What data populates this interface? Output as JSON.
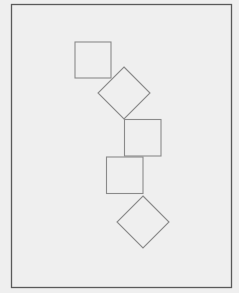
{
  "diagram": {
    "background": "#efefef",
    "frame": {
      "x": 11.5,
      "y": 4.5,
      "width": 220,
      "height": 283,
      "stroke": "#5a5a5a",
      "stroke_width": 1.3
    },
    "shape_stroke": "#8a8a8a",
    "shapes": [
      {
        "type": "square",
        "x": 75,
        "y": 42,
        "size": 36
      },
      {
        "type": "diamond",
        "cx": 124,
        "cy": 93,
        "r": 26
      },
      {
        "type": "square",
        "x": 124.5,
        "y": 119.5,
        "size": 36.5
      },
      {
        "type": "square",
        "x": 106.5,
        "y": 157,
        "size": 36.5
      },
      {
        "type": "diamond",
        "cx": 143,
        "cy": 222,
        "r": 26
      }
    ]
  }
}
